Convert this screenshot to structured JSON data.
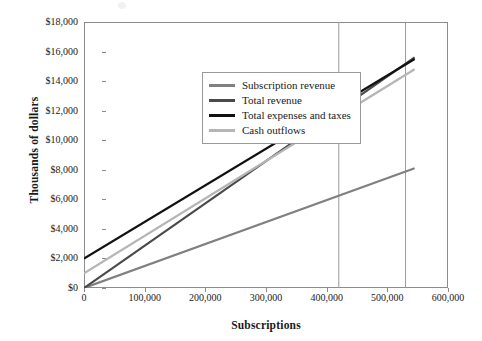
{
  "chart_data": {
    "type": "line",
    "title": "",
    "xlabel": "Subscriptions",
    "ylabel": "Thousands of dollars",
    "xlim": [
      0,
      600000
    ],
    "ylim": [
      0,
      18000
    ],
    "grid": false,
    "legend_position": "upper left inside plot",
    "x_ticks": [
      0,
      100000,
      200000,
      300000,
      400000,
      500000,
      600000
    ],
    "x_tick_labels": [
      "0",
      "100,000",
      "200,000",
      "300,000",
      "400,000",
      "500,000",
      "600,000"
    ],
    "y_ticks": [
      0,
      2000,
      4000,
      6000,
      8000,
      10000,
      12000,
      14000,
      16000,
      18000
    ],
    "y_tick_labels": [
      "$0",
      "$2,000",
      "$4,000",
      "$6,000",
      "$8,000",
      "$10,000",
      "$12,000",
      "$14,000",
      "$16,000",
      "$18,000"
    ],
    "series": [
      {
        "name": "Subscription revenue",
        "color": "#808080",
        "width": 2.2,
        "x": [
          0,
          545000
        ],
        "values": [
          0,
          8100
        ]
      },
      {
        "name": "Total revenue",
        "color": "#4a4a4a",
        "width": 2.2,
        "x": [
          0,
          545000
        ],
        "values": [
          0,
          15600
        ]
      },
      {
        "name": "Total expenses and taxes",
        "color": "#111111",
        "width": 2.2,
        "x": [
          0,
          545000
        ],
        "values": [
          2000,
          15500
        ]
      },
      {
        "name": "Cash outflows",
        "color": "#b5b5b5",
        "width": 2.2,
        "x": [
          0,
          545000
        ],
        "values": [
          1000,
          14800
        ]
      }
    ],
    "reference_lines": [
      {
        "name": "breakeven-line-1",
        "x": 420000,
        "color": "#9a9a9a"
      },
      {
        "name": "breakeven-line-2",
        "x": 530000,
        "color": "#9a9a9a"
      }
    ],
    "axis_color": "#8c8c8c",
    "background": "#ffffff"
  }
}
